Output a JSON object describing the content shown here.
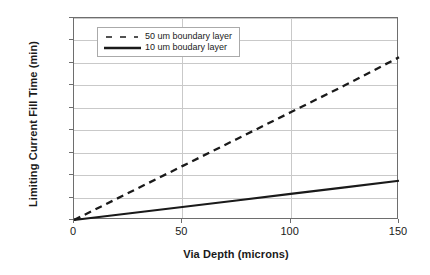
{
  "chart_data": {
    "type": "line",
    "title": "",
    "xlabel": "Via Depth (microns)",
    "ylabel": "Limiting Current Fill Time (min)",
    "xlim": [
      0,
      150
    ],
    "ylim": [
      0,
      180
    ],
    "xticks": [
      "0",
      "50",
      "100",
      "150"
    ],
    "xtick_values": [
      0,
      50,
      100,
      150
    ],
    "yticks": [
      "0",
      "20",
      "40",
      "60",
      "80",
      "100",
      "120",
      "140",
      "160",
      "180"
    ],
    "ytick_values": [
      0,
      20,
      40,
      60,
      80,
      100,
      120,
      140,
      160,
      180
    ],
    "grid": "horizontal-and-vertical",
    "legend_position": "upper-left-inside",
    "x": [
      0,
      25,
      50,
      75,
      100,
      125,
      150
    ],
    "series": [
      {
        "name": "50 um boundary layer",
        "style": "dashed",
        "color": "#1a1a1a",
        "values": [
          0,
          24,
          48,
          72,
          96,
          120,
          145
        ]
      },
      {
        "name": "10 um boudary layer",
        "style": "solid",
        "color": "#1a1a1a",
        "values": [
          0,
          5.8,
          11.6,
          17.4,
          23.2,
          29,
          35
        ]
      }
    ],
    "annotations": []
  },
  "legend": {
    "items": [
      {
        "label": "50 um boundary layer",
        "style": "dashed"
      },
      {
        "label": "10 um boudary layer",
        "style": "solid"
      }
    ]
  },
  "colors": {
    "line": "#1a1a1a",
    "grid": "#c9c9c9",
    "axis": "#6e6e6e",
    "text": "#1a1a1a",
    "background": "#ffffff"
  }
}
